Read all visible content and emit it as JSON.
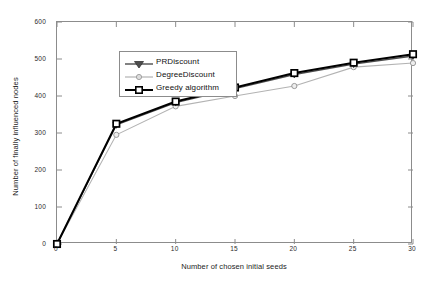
{
  "chart_data": {
    "type": "line",
    "title": "",
    "xlabel": "Number of chosen initial seeds",
    "ylabel": "Number of finally influenced nodes",
    "x": [
      0,
      5,
      10,
      15,
      20,
      25,
      30
    ],
    "xlim": [
      0,
      30
    ],
    "ylim": [
      0,
      600
    ],
    "xticks": [
      "0",
      "5",
      "10",
      "15",
      "20",
      "25",
      "30"
    ],
    "yticks": [
      "0",
      "100",
      "200",
      "300",
      "400",
      "500",
      "600"
    ],
    "grid": false,
    "legend_position": "upper left",
    "series": [
      {
        "name": "PRDiscount",
        "marker": "triangle-down",
        "color": "#4d4d4d",
        "values": [
          0,
          322,
          382,
          420,
          458,
          486,
          508
        ]
      },
      {
        "name": "DegreeDiscount",
        "marker": "circle",
        "color": "#b3b3b3",
        "values": [
          0,
          295,
          372,
          400,
          427,
          478,
          489
        ]
      },
      {
        "name": "Greedy algorithm",
        "marker": "square",
        "color": "#000000",
        "values": [
          0,
          325,
          385,
          423,
          462,
          490,
          513
        ]
      }
    ]
  },
  "legend": {
    "items": [
      {
        "label": "PRDiscount"
      },
      {
        "label": "DegreeDiscount"
      },
      {
        "label": "Greedy algorithm"
      }
    ]
  },
  "axes": {
    "frame_color": "#8c8c8c"
  }
}
